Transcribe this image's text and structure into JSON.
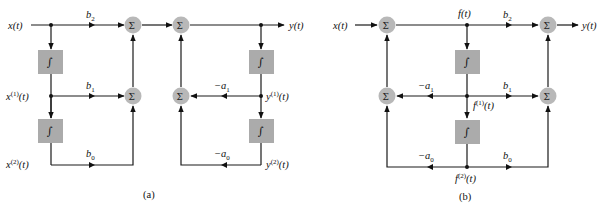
{
  "diagram": {
    "type": "block-diagram",
    "colors": {
      "wire": "#1a1a1a",
      "summer_fill": "#b8b8b8",
      "integrator_fill": "#ababab",
      "background": "#ffffff"
    },
    "symbols": {
      "summer": "Σ",
      "integrator": "∫"
    },
    "panel_a": {
      "caption": "(a)",
      "input_label": "x(t)",
      "output_label": "y(t)",
      "signals": {
        "x1": {
          "base": "x",
          "sup": "(1)",
          "arg": "(t)"
        },
        "x2": {
          "base": "x",
          "sup": "(2)",
          "arg": "(t)"
        },
        "y1": {
          "base": "y",
          "sup": "(1)",
          "arg": "(t)"
        },
        "y2": {
          "base": "y",
          "sup": "(2)",
          "arg": "(t)"
        }
      },
      "gains": {
        "b2": {
          "base": "b",
          "sub": "2"
        },
        "b1": {
          "base": "b",
          "sub": "1"
        },
        "b0": {
          "base": "b",
          "sub": "0"
        },
        "a1": {
          "base": "−a",
          "sub": "1"
        },
        "a0": {
          "base": "−a",
          "sub": "0"
        }
      }
    },
    "panel_b": {
      "caption": "(b)",
      "input_label": "x(t)",
      "output_label": "y(t)",
      "signals": {
        "f": "f(t)",
        "f1": {
          "base": "f",
          "sup": "(1)",
          "arg": "(t)"
        },
        "f2": {
          "base": "f",
          "sup": "(2)",
          "arg": "(t)"
        }
      },
      "gains": {
        "b2": {
          "base": "b",
          "sub": "2"
        },
        "b1": {
          "base": "b",
          "sub": "1"
        },
        "b0": {
          "base": "b",
          "sub": "0"
        },
        "a1": {
          "base": "−a",
          "sub": "1"
        },
        "a0": {
          "base": "−a",
          "sub": "0"
        }
      }
    }
  }
}
